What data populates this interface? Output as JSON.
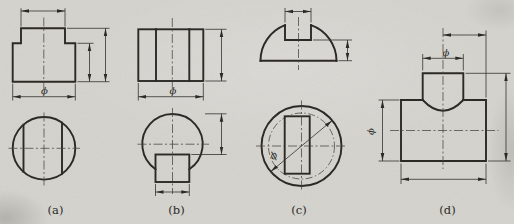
{
  "figure": {
    "subfigure_labels": [
      "(a)",
      "(b)",
      "(c)",
      "(d)"
    ],
    "diameter_symbol": "ϕ",
    "colors": {
      "paper": "#d7d5d0",
      "outline": "#2c2a26",
      "thin_line": "#34322e",
      "centerline": "#45433f"
    }
  }
}
